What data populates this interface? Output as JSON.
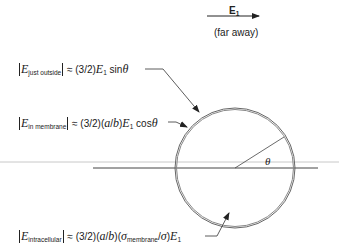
{
  "field": {
    "symbol": "E",
    "subscript": "1",
    "note": "(far away)"
  },
  "angle_label": "θ",
  "labels": {
    "just_outside": {
      "subscript": "just outside",
      "rhs": " ≈ (3/2)",
      "rhs_e": "E",
      "rhs_e_sub": "1",
      "rhs_tail": " sin",
      "rhs_theta": "θ"
    },
    "in_membrane": {
      "subscript": "in membrane",
      "rhs": " ≈ (3/2)(",
      "rhs_a": "a",
      "rhs_slash": "/",
      "rhs_b": "b",
      "rhs_close": ")",
      "rhs_e": "E",
      "rhs_e_sub": "1",
      "rhs_tail": " cos",
      "rhs_theta": "θ"
    },
    "intracellular": {
      "subscript": "intracellular",
      "rhs": " ≈ (3/2)(",
      "rhs_a": "a",
      "rhs_slash": "/",
      "rhs_b": "b",
      "rhs_mid": ")(",
      "rhs_sigma": "σ",
      "rhs_sigma_sub": "membrane",
      "rhs_slash2": "/",
      "rhs_sigma2": "σ",
      "rhs_close": ")",
      "rhs_e": "E",
      "rhs_e_sub": "1"
    }
  },
  "colors": {
    "line": "#333333",
    "faint_line": "#c8c8c8",
    "circle": "#555555"
  }
}
